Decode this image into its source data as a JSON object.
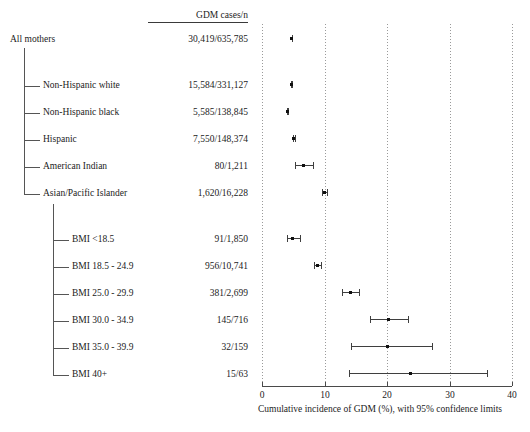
{
  "figure": {
    "column_header": "GDM cases/n",
    "axis_title": "Cumulative incidence of GDM (%), with 95% confidence limits"
  },
  "chart_data": {
    "type": "scatter",
    "subtype": "forest-plot",
    "title": "",
    "xlabel": "Cumulative incidence of GDM (%), with 95% confidence limits",
    "ylabel": "",
    "xlim": [
      0,
      40
    ],
    "xticks": [
      0,
      10,
      20,
      30,
      40
    ],
    "xtick_labels": [
      "0",
      "10",
      "20",
      "30",
      "40"
    ],
    "grid": true,
    "grid_axis": "x",
    "grid_style": "dotted",
    "legend": false,
    "value_column_header": "GDM cases/n",
    "rows": [
      {
        "label": "All mothers",
        "level": 0,
        "group": "overall",
        "cases": "30,419",
        "n": "635,785",
        "count_text": "30,419/635,785",
        "estimate": 4.78,
        "ci_low": 4.73,
        "ci_high": 4.84
      },
      {
        "label": "Non-Hispanic white",
        "level": 1,
        "group": "race",
        "cases": "15,584",
        "n": "331,127",
        "count_text": "15,584/331,127",
        "estimate": 4.71,
        "ci_low": 4.64,
        "ci_high": 4.78
      },
      {
        "label": "Non-Hispanic black",
        "level": 1,
        "group": "race",
        "cases": "5,585",
        "n": "138,845",
        "count_text": "5,585/138,845",
        "estimate": 4.02,
        "ci_low": 3.92,
        "ci_high": 4.13
      },
      {
        "label": "Hispanic",
        "level": 1,
        "group": "race",
        "cases": "7,550",
        "n": "148,374",
        "count_text": "7,550/148,374",
        "estimate": 5.09,
        "ci_low": 4.98,
        "ci_high": 5.2
      },
      {
        "label": "American Indian",
        "level": 1,
        "group": "race",
        "cases": "80",
        "n": "1,211",
        "count_text": "80/1,211",
        "estimate": 6.61,
        "ci_low": 5.28,
        "ci_high": 8.15
      },
      {
        "label": "Asian/Pacific Islander",
        "level": 1,
        "group": "race",
        "cases": "1,620",
        "n": "16,228",
        "count_text": "1,620/16,228",
        "estimate": 9.98,
        "ci_low": 9.53,
        "ci_high": 10.45
      },
      {
        "label": "BMI <18.5",
        "level": 1,
        "group": "bmi",
        "cases": "91",
        "n": "1,850",
        "count_text": "91/1,850",
        "estimate": 4.92,
        "ci_low": 3.98,
        "ci_high": 6.01
      },
      {
        "label": "BMI 18.5 - 24.9",
        "level": 1,
        "group": "bmi",
        "cases": "956",
        "n": "10,741",
        "count_text": "956/10,741",
        "estimate": 8.9,
        "ci_low": 8.37,
        "ci_high": 9.46
      },
      {
        "label": "BMI 25.0 - 29.9",
        "level": 1,
        "group": "bmi",
        "cases": "381",
        "n": "2,699",
        "count_text": "381/2,699",
        "estimate": 14.12,
        "ci_low": 12.83,
        "ci_high": 15.5
      },
      {
        "label": "BMI 30.0 - 34.9",
        "level": 1,
        "group": "bmi",
        "cases": "145",
        "n": "716",
        "count_text": "145/716",
        "estimate": 20.25,
        "ci_low": 17.34,
        "ci_high": 23.43
      },
      {
        "label": "BMI 35.0 - 39.9",
        "level": 1,
        "group": "bmi",
        "cases": "32",
        "n": "159",
        "count_text": "32/159",
        "estimate": 20.13,
        "ci_low": 14.17,
        "ci_high": 27.26
      },
      {
        "label": "BMI 40+",
        "level": 1,
        "group": "bmi",
        "cases": "15",
        "n": "63",
        "count_text": "15/63",
        "estimate": 23.81,
        "ci_low": 13.94,
        "ci_high": 36.05
      }
    ]
  }
}
